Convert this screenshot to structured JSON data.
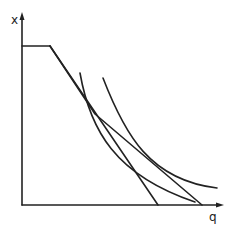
{
  "diagram": {
    "axes": {
      "y_label": "x",
      "x_label": "q"
    },
    "colors": {
      "stroke": "#222222",
      "background": "#ffffff"
    },
    "elements": [
      {
        "name": "budget-constraint-flat-segment",
        "type": "line"
      },
      {
        "name": "straight-budget-line",
        "type": "line"
      },
      {
        "name": "kinked-budget-line",
        "type": "polyline"
      },
      {
        "name": "indifference-curve-inner",
        "type": "curve"
      },
      {
        "name": "indifference-curve-outer",
        "type": "curve"
      }
    ]
  }
}
